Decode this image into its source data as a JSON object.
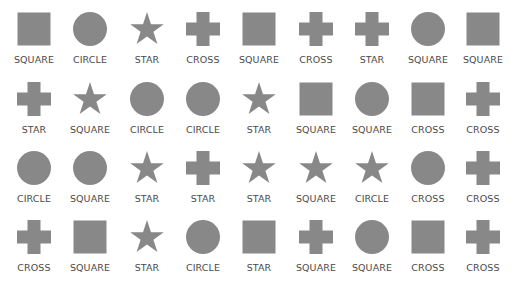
{
  "style": {
    "shape_color": "#888888",
    "label_color": "#4a4a4a",
    "background": "#ffffff"
  },
  "grid": {
    "rows": 4,
    "cols": 9,
    "cells": [
      [
        {
          "shape": "square",
          "label": "SQUARE"
        },
        {
          "shape": "circle",
          "label": "CIRCLE"
        },
        {
          "shape": "star",
          "label": "STAR"
        },
        {
          "shape": "cross",
          "label": "CROSS"
        },
        {
          "shape": "square",
          "label": "SQUARE"
        },
        {
          "shape": "cross",
          "label": "CROSS"
        },
        {
          "shape": "cross",
          "label": "STAR"
        },
        {
          "shape": "circle",
          "label": "SQUARE"
        },
        {
          "shape": "square",
          "label": "SQUARE"
        }
      ],
      [
        {
          "shape": "cross",
          "label": "STAR"
        },
        {
          "shape": "star",
          "label": "SQUARE"
        },
        {
          "shape": "circle",
          "label": "CIRCLE"
        },
        {
          "shape": "circle",
          "label": "CIRCLE"
        },
        {
          "shape": "star",
          "label": "STAR"
        },
        {
          "shape": "square",
          "label": "SQUARE"
        },
        {
          "shape": "circle",
          "label": "SQUARE"
        },
        {
          "shape": "square",
          "label": "CROSS"
        },
        {
          "shape": "cross",
          "label": "CROSS"
        }
      ],
      [
        {
          "shape": "circle",
          "label": "CIRCLE"
        },
        {
          "shape": "circle",
          "label": "SQUARE"
        },
        {
          "shape": "star",
          "label": "STAR"
        },
        {
          "shape": "cross",
          "label": "STAR"
        },
        {
          "shape": "star",
          "label": "STAR"
        },
        {
          "shape": "star",
          "label": "SQUARE"
        },
        {
          "shape": "star",
          "label": "CIRCLE"
        },
        {
          "shape": "circle",
          "label": "CROSS"
        },
        {
          "shape": "cross",
          "label": "CROSS"
        }
      ],
      [
        {
          "shape": "cross",
          "label": "CROSS"
        },
        {
          "shape": "square",
          "label": "SQUARE"
        },
        {
          "shape": "star",
          "label": "STAR"
        },
        {
          "shape": "circle",
          "label": "CIRCLE"
        },
        {
          "shape": "square",
          "label": "STAR"
        },
        {
          "shape": "cross",
          "label": "SQUARE"
        },
        {
          "shape": "circle",
          "label": "SQUARE"
        },
        {
          "shape": "square",
          "label": "CROSS"
        },
        {
          "shape": "cross",
          "label": "CROSS"
        }
      ]
    ]
  }
}
